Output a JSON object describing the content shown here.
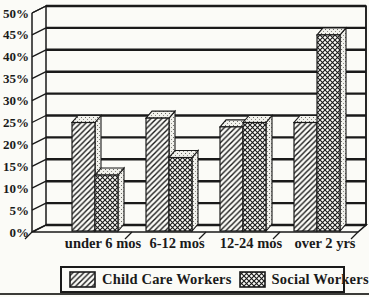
{
  "chart_data": {
    "type": "bar",
    "style": "monochrome-3d-patterned",
    "title": "",
    "categories": [
      "under 6 mos",
      "6-12 mos",
      "12-24 mos",
      "over 2 yrs"
    ],
    "series": [
      {
        "name": "Child Care Workers",
        "pattern": "diagonal-hatch",
        "values": [
          25,
          26,
          24,
          25
        ]
      },
      {
        "name": "Social Workers",
        "pattern": "crosshatch",
        "values": [
          13,
          17,
          25,
          45
        ]
      }
    ],
    "y_ticks": [
      "0%",
      "5%",
      "10%",
      "15%",
      "20%",
      "25%",
      "30%",
      "35%",
      "40%",
      "45%",
      "50%"
    ],
    "axis": {
      "min": 0,
      "max": 50,
      "step": 5,
      "format": "percent"
    },
    "grid": true,
    "legend_position": "bottom"
  },
  "colors": {
    "ink": "#1a1a1a",
    "paper": "#fbfbf7"
  }
}
